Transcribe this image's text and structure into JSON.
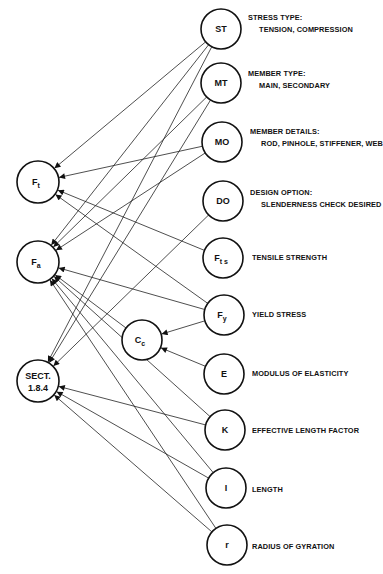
{
  "diagram": {
    "type": "dependency-graph",
    "nodes": [
      {
        "id": "ST",
        "label": "ST",
        "sub": "",
        "x": 221,
        "y": 29,
        "r": 20,
        "column": "input"
      },
      {
        "id": "MT",
        "label": "MT",
        "sub": "",
        "x": 221,
        "y": 83,
        "r": 20,
        "column": "input"
      },
      {
        "id": "MO",
        "label": "MO",
        "sub": "",
        "x": 222,
        "y": 142,
        "r": 20,
        "column": "input"
      },
      {
        "id": "DO",
        "label": "DO",
        "sub": "",
        "x": 223,
        "y": 201,
        "r": 20,
        "column": "input"
      },
      {
        "id": "Fts",
        "label": "F",
        "sub": "t s",
        "x": 223,
        "y": 258,
        "r": 20,
        "column": "input"
      },
      {
        "id": "Fy",
        "label": "F",
        "sub": "y",
        "x": 224,
        "y": 315,
        "r": 20,
        "column": "input"
      },
      {
        "id": "E",
        "label": "E",
        "sub": "",
        "x": 224,
        "y": 374,
        "r": 20,
        "column": "input"
      },
      {
        "id": "K",
        "label": "K",
        "sub": "",
        "x": 225,
        "y": 430,
        "r": 20,
        "column": "input"
      },
      {
        "id": "I",
        "label": "I",
        "sub": "",
        "x": 226,
        "y": 488,
        "r": 20,
        "column": "input"
      },
      {
        "id": "r",
        "label": "r",
        "sub": "",
        "x": 227,
        "y": 545,
        "r": 20,
        "column": "input"
      },
      {
        "id": "Cc",
        "label": "C",
        "sub": "c",
        "x": 142,
        "y": 340,
        "r": 20,
        "column": "intermediate"
      },
      {
        "id": "Ft",
        "label": "F",
        "sub": "t",
        "x": 38,
        "y": 182,
        "r": 21,
        "column": "output"
      },
      {
        "id": "Fa",
        "label": "F",
        "sub": "a",
        "x": 38,
        "y": 262,
        "r": 21,
        "column": "output"
      },
      {
        "id": "SECT",
        "label": "SECT.",
        "sub": "1.8.4",
        "x": 38,
        "y": 381,
        "r": 21,
        "column": "output"
      }
    ],
    "edges": [
      {
        "from": "ST",
        "to": "Ft"
      },
      {
        "from": "ST",
        "to": "Fa"
      },
      {
        "from": "ST",
        "to": "SECT"
      },
      {
        "from": "MT",
        "to": "Fa"
      },
      {
        "from": "MT",
        "to": "SECT"
      },
      {
        "from": "MO",
        "to": "Ft"
      },
      {
        "from": "MO",
        "to": "Fa"
      },
      {
        "from": "DO",
        "to": "SECT"
      },
      {
        "from": "Fts",
        "to": "Ft"
      },
      {
        "from": "Fy",
        "to": "Ft"
      },
      {
        "from": "Fy",
        "to": "Fa"
      },
      {
        "from": "Fy",
        "to": "Cc"
      },
      {
        "from": "E",
        "to": "Cc"
      },
      {
        "from": "Cc",
        "to": "Fa"
      },
      {
        "from": "K",
        "to": "Fa"
      },
      {
        "from": "K",
        "to": "SECT"
      },
      {
        "from": "I",
        "to": "Fa"
      },
      {
        "from": "I",
        "to": "SECT"
      },
      {
        "from": "r",
        "to": "Fa"
      },
      {
        "from": "r",
        "to": "SECT"
      }
    ]
  },
  "labels": [
    {
      "node": "ST",
      "title": "STRESS TYPE:",
      "detail": "TENSION, COMPRESSION",
      "x": 248,
      "y": 13
    },
    {
      "node": "MT",
      "title": "MEMBER TYPE:",
      "detail": "MAIN, SECONDARY",
      "x": 248,
      "y": 69
    },
    {
      "node": "MO",
      "title": "MEMBER DETAILS:",
      "detail": "ROD, PINHOLE, STIFFENER, WEB",
      "x": 250,
      "y": 127
    },
    {
      "node": "DO",
      "title": "DESIGN OPTION:",
      "detail": "SLENDERNESS CHECK DESIRED",
      "x": 250,
      "y": 188
    },
    {
      "node": "Fts",
      "title": "TENSILE STRENGTH",
      "detail": "",
      "x": 252,
      "y": 253
    },
    {
      "node": "Fy",
      "title": "YIELD STRESS",
      "detail": "",
      "x": 252,
      "y": 310
    },
    {
      "node": "E",
      "title": "MODULUS OF ELASTICITY",
      "detail": "",
      "x": 252,
      "y": 369
    },
    {
      "node": "K",
      "title": "EFFECTIVE LENGTH FACTOR",
      "detail": "",
      "x": 252,
      "y": 426
    },
    {
      "node": "I",
      "title": "LENGTH",
      "detail": "",
      "x": 252,
      "y": 485
    },
    {
      "node": "r",
      "title": "RADIUS OF GYRATION",
      "detail": "",
      "x": 252,
      "y": 542
    }
  ]
}
